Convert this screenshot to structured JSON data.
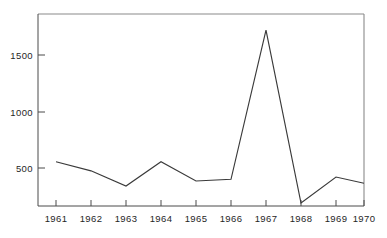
{
  "chart_data": {
    "type": "line",
    "title": "",
    "subtitle": "",
    "xlabel": "",
    "ylabel": "",
    "categories": [
      "1961",
      "1962",
      "1963",
      "1964",
      "1965",
      "1966",
      "1967",
      "1968",
      "1969",
      "1970"
    ],
    "values": [
      555,
      475,
      340,
      555,
      385,
      400,
      1720,
      190,
      420,
      365
    ],
    "series": [
      {
        "name": "series-1",
        "values": [
          555,
          475,
          340,
          555,
          385,
          400,
          1720,
          190,
          420,
          365
        ]
      }
    ],
    "x": [
      1961,
      1962,
      1963,
      1964,
      1965,
      1966,
      1967,
      1968,
      1969,
      1970
    ],
    "xlim": [
      1960.5,
      1970.5
    ],
    "ylim": [
      0,
      1820
    ],
    "ytick_values": [
      500,
      1000,
      1500
    ],
    "ytick_labels": [
      "500",
      "1000",
      "1500"
    ],
    "xtick_labels": [
      "1961",
      "1962",
      "1963",
      "1964",
      "1965",
      "1966",
      "1967",
      "1968",
      "1969",
      "1970"
    ],
    "grid": false,
    "legend": false,
    "legend_position": "none",
    "annotations": [],
    "line_color": "#3a3a3a",
    "axis_color": "#4a4a4a",
    "frame_color": "#8a8a8a",
    "background_color": "#ffffff"
  },
  "axes": {
    "y": {
      "ticks": [
        {
          "label": "500",
          "value": 500
        },
        {
          "label": "1000",
          "value": 1000
        },
        {
          "label": "1500",
          "value": 1500
        }
      ]
    },
    "x": {
      "ticks": [
        {
          "label": "1961",
          "value": 1961
        },
        {
          "label": "1962",
          "value": 1962
        },
        {
          "label": "1963",
          "value": 1963
        },
        {
          "label": "1964",
          "value": 1964
        },
        {
          "label": "1965",
          "value": 1965
        },
        {
          "label": "1966",
          "value": 1966
        },
        {
          "label": "1967",
          "value": 1967
        },
        {
          "label": "1968",
          "value": 1968
        },
        {
          "label": "1969",
          "value": 1969
        },
        {
          "label": "1970",
          "value": 1970
        }
      ]
    }
  }
}
